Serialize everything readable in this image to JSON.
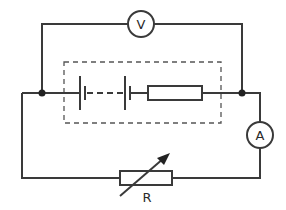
{
  "diagram": {
    "type": "circuit",
    "components": {
      "voltmeter": {
        "label": "V"
      },
      "ammeter": {
        "label": "A"
      },
      "variable_resistor": {
        "label": "R"
      },
      "battery": {
        "cells": 2,
        "note": "cells connected with dashed line inside dashed box"
      },
      "internal_resistor": {
        "label": ""
      }
    },
    "colors": {
      "line": "#3a3a3a",
      "background": "#ffffff"
    }
  }
}
